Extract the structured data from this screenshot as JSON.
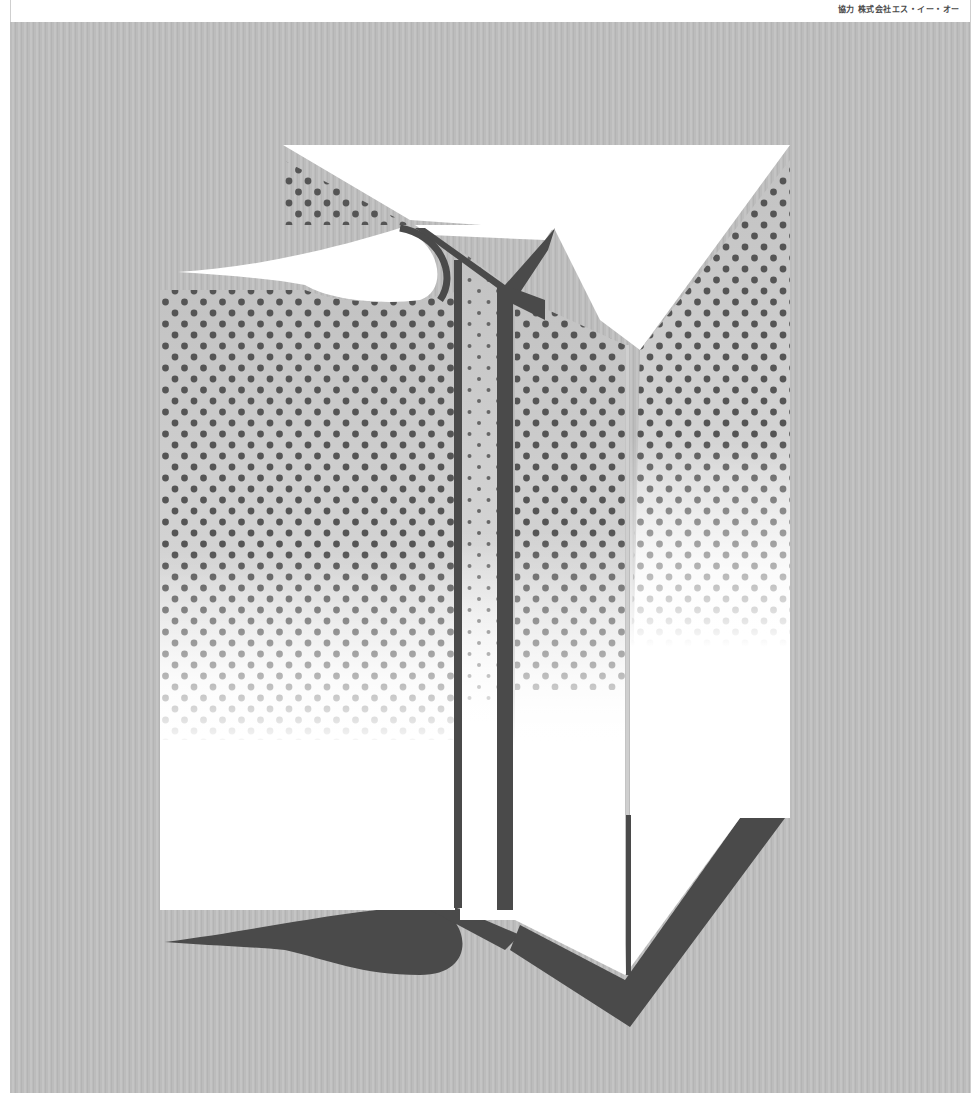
{
  "header": {
    "credit": "協力 株式会社エス・イー・オー"
  },
  "poster": {
    "description": "Abstract pop-art illustration of a white box/book with halftone dot shading and dark shadows on a grey background",
    "colors": {
      "background": "#bdbdbd",
      "shape_fill": "#ffffff",
      "shadow": "#4a4a4a",
      "dots": "#555555"
    }
  }
}
